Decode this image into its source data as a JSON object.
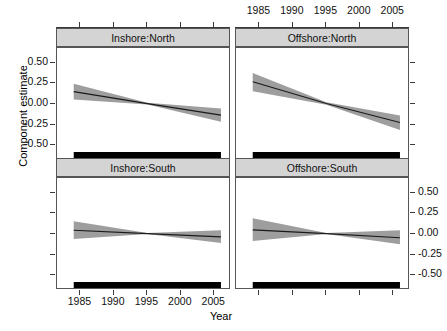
{
  "figure": {
    "xtitle": "Year",
    "ytitle": "Component estimate"
  },
  "axes": {
    "x_ticks": [
      "1985",
      "1990",
      "1995",
      "2000",
      "2005"
    ],
    "x_tick_values": [
      1985,
      1990,
      1995,
      2000,
      2005
    ],
    "y_ticks": [
      "0.50",
      "0.25",
      "0.00",
      "-0.25",
      "-0.50"
    ],
    "y_tick_values": [
      0.5,
      0.25,
      0.0,
      -0.25,
      -0.5
    ],
    "xlim": [
      1981.5,
      2007.5
    ],
    "ylim": [
      -0.68,
      0.68
    ],
    "top_axis_panel": "Offshore:North",
    "bottom_axis_panel": "Inshore:South",
    "left_axis_panel": "Inshore:North",
    "right_axis_panel": "Offshore:South"
  },
  "strips": {
    "top_left": "Inshore:North",
    "top_right": "Offshore:North",
    "bottom_left": "Inshore:South",
    "bottom_right": "Offshore:South"
  },
  "colors": {
    "band": "#9e9e9e",
    "line": "#1a1a1a",
    "strip_bg": "#d4d4d4",
    "panel_border": "#555555",
    "rug": "#000000"
  },
  "chart_data": {
    "type": "line",
    "title": "",
    "xlabel": "Year",
    "ylabel": "Component estimate",
    "xlim": [
      1981.5,
      2007.5
    ],
    "ylim": [
      -0.68,
      0.68
    ],
    "grid": false,
    "legend": "none",
    "layout": "2x2 trellis (Area:Region)",
    "panels": [
      {
        "name": "Inshore:North",
        "row": 0,
        "col": 0,
        "x": [
          1984,
          1995,
          2006
        ],
        "fit": [
          0.15,
          0.005,
          -0.135
        ],
        "ci_lower": [
          0.055,
          -0.005,
          -0.215
        ],
        "ci_upper": [
          0.245,
          0.015,
          -0.055
        ],
        "rug_range": [
          1984,
          2006
        ]
      },
      {
        "name": "Offshore:North",
        "row": 0,
        "col": 1,
        "x": [
          1984,
          1995,
          2006
        ],
        "fit": [
          0.27,
          0.005,
          -0.225
        ],
        "ci_lower": [
          0.155,
          -0.01,
          -0.315
        ],
        "ci_upper": [
          0.375,
          0.02,
          -0.14
        ],
        "rug_range": [
          1984,
          2006
        ]
      },
      {
        "name": "Inshore:South",
        "row": 1,
        "col": 0,
        "x": [
          1984,
          1995,
          2006
        ],
        "fit": [
          0.045,
          0.005,
          -0.035
        ],
        "ci_lower": [
          -0.06,
          0.0,
          -0.11
        ],
        "ci_upper": [
          0.155,
          0.012,
          0.045
        ],
        "rug_range": [
          1984,
          2006
        ]
      },
      {
        "name": "Offshore:South",
        "row": 1,
        "col": 1,
        "x": [
          1984,
          1995,
          2006
        ],
        "fit": [
          0.05,
          0.005,
          -0.045
        ],
        "ci_lower": [
          -0.085,
          0.0,
          -0.125
        ],
        "ci_upper": [
          0.19,
          0.012,
          0.045
        ],
        "rug_range": [
          1984,
          2006
        ]
      }
    ]
  }
}
